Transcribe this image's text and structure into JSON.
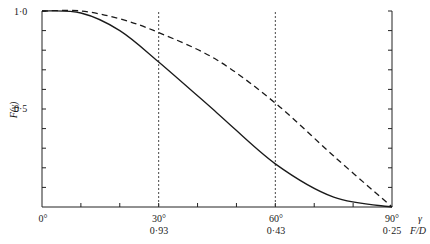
{
  "chart_data": {
    "type": "line",
    "title": "",
    "xlabel": "γ",
    "xlabel_secondary": "F/D",
    "ylabel": "F(γ)",
    "x_unit": "degrees",
    "xlim": [
      0,
      90
    ],
    "ylim": [
      0,
      1.0
    ],
    "x_ticks_minor_step": 10,
    "y_ticks_minor_step": 0.1,
    "x_tick_labels": [
      {
        "x": 0,
        "label": "0°",
        "secondary": ""
      },
      {
        "x": 30,
        "label": "30°",
        "secondary": "0·93"
      },
      {
        "x": 60,
        "label": "60°",
        "secondary": "0·43"
      },
      {
        "x": 90,
        "label": "90°",
        "secondary": "0·25"
      }
    ],
    "y_tick_labels": [
      {
        "y": 1.0,
        "label": "1·0"
      },
      {
        "y": 0.5,
        "label": "0·5"
      }
    ],
    "reference_lines": [
      {
        "orientation": "vertical",
        "x": 30,
        "style": "dotted"
      },
      {
        "orientation": "vertical",
        "x": 60,
        "style": "dotted"
      }
    ],
    "grid": false,
    "legend": null,
    "x": [
      0,
      10,
      20,
      30,
      45,
      60,
      75,
      90
    ],
    "series": [
      {
        "name": "solid curve",
        "style": "solid",
        "values": [
          1.0,
          0.99,
          0.9,
          0.74,
          0.48,
          0.22,
          0.05,
          0.0
        ]
      },
      {
        "name": "dashed curve",
        "style": "dashed",
        "values": [
          1.0,
          1.0,
          0.96,
          0.89,
          0.75,
          0.53,
          0.26,
          0.0
        ]
      }
    ],
    "frame": {
      "left_axis": true,
      "right_axis": true,
      "bottom_axis": true,
      "top_axis": false
    }
  },
  "labels": {
    "y_top": "1·0",
    "y_mid": "0·5",
    "y_title": "F(γ)",
    "x0": "0°",
    "x30": "30°",
    "x30_fd": "0·93",
    "x60": "60°",
    "x60_fd": "0·43",
    "x90": "90°",
    "x90_fd": "0·25",
    "x_title_gamma": "γ",
    "x_title_fd": "F/D"
  }
}
